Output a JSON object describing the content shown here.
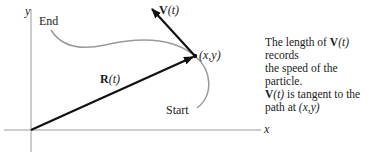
{
  "diagram": {
    "axes": {
      "x_label": "x",
      "y_label": "y"
    },
    "curve": {
      "start_label": "Start",
      "end_label": "End"
    },
    "position_vector": {
      "label_bold": "R",
      "label_arg": "(t)"
    },
    "velocity_vector": {
      "label_bold": "V",
      "label_arg": "(t)"
    },
    "point": {
      "label": "(x,y)"
    },
    "colors": {
      "axes": "#9a9a9a",
      "curve": "#9a9a9a",
      "vectors": "#111111"
    }
  },
  "caption": {
    "line1_pre": "The length of ",
    "line1_bold": "V",
    "line1_arg": "(t)",
    "line1_post": " records",
    "line2": "the speed of the particle.",
    "line3_bold": "V",
    "line3_arg": "(t)",
    "line3_post": " is tangent to the",
    "line4_pre": "path at ",
    "line4_point": "(x,y)"
  }
}
